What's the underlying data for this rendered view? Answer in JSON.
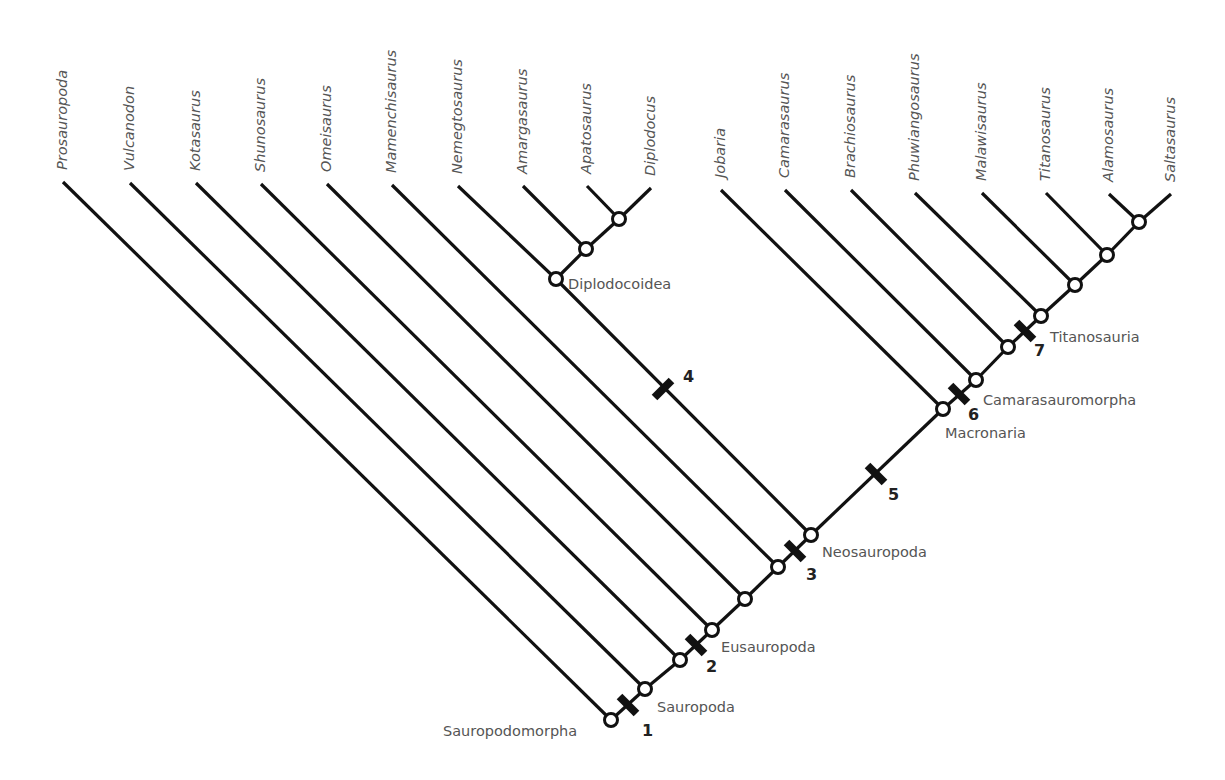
{
  "diagram": {
    "type": "cladogram",
    "colors": {
      "line": "#111111",
      "text": "#555555",
      "number": "#222222",
      "node_fill": "#ffffff",
      "background": "#ffffff"
    },
    "taxa": [
      {
        "name": "Prosauropoda",
        "tip": [
          63,
          182
        ],
        "node": "n0"
      },
      {
        "name": "Vulcanodon",
        "tip": [
          130,
          183
        ],
        "node": "n1"
      },
      {
        "name": "Kotasaurus",
        "tip": [
          196,
          183
        ],
        "node": "n2"
      },
      {
        "name": "Shunosaurus",
        "tip": [
          261,
          184
        ],
        "node": "n3"
      },
      {
        "name": "Omeisaurus",
        "tip": [
          327,
          184
        ],
        "node": "n4"
      },
      {
        "name": "Mamenchisaurus",
        "tip": [
          392,
          185
        ],
        "node": "n5"
      },
      {
        "name": "Nemegtosaurus",
        "tip": [
          458,
          186
        ],
        "node": "d0"
      },
      {
        "name": "Amargasaurus",
        "tip": [
          523,
          186
        ],
        "node": "d1"
      },
      {
        "name": "Apatosaurus",
        "tip": [
          587,
          186
        ],
        "node": "d2"
      },
      {
        "name": "Diplodocus",
        "tip": [
          651,
          188
        ],
        "node": "d2"
      },
      {
        "name": "Jobaria",
        "tip": [
          721,
          190
        ],
        "node": "m0"
      },
      {
        "name": "Camarasaurus",
        "tip": [
          785,
          190
        ],
        "node": "m1"
      },
      {
        "name": "Brachiosaurus",
        "tip": [
          851,
          190
        ],
        "node": "m2"
      },
      {
        "name": "Phuwiangosaurus",
        "tip": [
          915,
          193
        ],
        "node": "m3"
      },
      {
        "name": "Malawisaurus",
        "tip": [
          982,
          193
        ],
        "node": "m4"
      },
      {
        "name": "Titanosaurus",
        "tip": [
          1046,
          193
        ],
        "node": "m5"
      },
      {
        "name": "Alamosaurus",
        "tip": [
          1109,
          194
        ],
        "node": "m6"
      },
      {
        "name": "Saltasaurus",
        "tip": [
          1171,
          194
        ],
        "node": "m6"
      }
    ],
    "nodes": {
      "n0": [
        611,
        720
      ],
      "n1": [
        645,
        689
      ],
      "n2": [
        680,
        660
      ],
      "n3": [
        712,
        630
      ],
      "n4": [
        745,
        599
      ],
      "n5": [
        778,
        567
      ],
      "neo": [
        811,
        535
      ],
      "d0": [
        556,
        279
      ],
      "d1": [
        586,
        249
      ],
      "d2": [
        619,
        219
      ],
      "m0": [
        943,
        409
      ],
      "m1": [
        976,
        380
      ],
      "m2": [
        1008,
        347
      ],
      "m3": [
        1041,
        316
      ],
      "m4": [
        1075,
        285
      ],
      "m5": [
        1107,
        255
      ],
      "m6": [
        1139,
        222
      ]
    },
    "spine_edges": [
      [
        "n0",
        "n1"
      ],
      [
        "n1",
        "n2"
      ],
      [
        "n2",
        "n3"
      ],
      [
        "n3",
        "n4"
      ],
      [
        "n4",
        "n5"
      ],
      [
        "n5",
        "neo"
      ],
      [
        "neo",
        "m0"
      ],
      [
        "m0",
        "m1"
      ],
      [
        "m1",
        "m2"
      ],
      [
        "m2",
        "m3"
      ],
      [
        "m3",
        "m4"
      ],
      [
        "m4",
        "m5"
      ],
      [
        "m5",
        "m6"
      ],
      [
        "neo",
        "d0"
      ],
      [
        "d0",
        "d1"
      ],
      [
        "d1",
        "d2"
      ]
    ],
    "clades": [
      {
        "name": "Sauropodomorpha",
        "x": 443,
        "y": 736
      },
      {
        "name": "Sauropoda",
        "x": 657,
        "y": 712
      },
      {
        "name": "Eusauropoda",
        "x": 721,
        "y": 652
      },
      {
        "name": "Neosauropoda",
        "x": 822,
        "y": 557
      },
      {
        "name": "Diplodocoidea",
        "x": 568,
        "y": 289
      },
      {
        "name": "Macronaria",
        "x": 945,
        "y": 438
      },
      {
        "name": "Camarasauromorpha",
        "x": 983,
        "y": 405
      },
      {
        "name": "Titanosauria",
        "x": 1050,
        "y": 342
      }
    ],
    "synapomorphies": [
      {
        "label": "1",
        "center": [
          628,
          705
        ],
        "label_pos": [
          642,
          736
        ]
      },
      {
        "label": "2",
        "center": [
          696,
          645
        ],
        "label_pos": [
          706,
          672
        ]
      },
      {
        "label": "3",
        "center": [
          795,
          551
        ],
        "label_pos": [
          806,
          580
        ]
      },
      {
        "label": "4",
        "center": [
          663,
          389
        ],
        "label_pos": [
          683,
          382
        ]
      },
      {
        "label": "5",
        "center": [
          876,
          474
        ],
        "label_pos": [
          888,
          500
        ]
      },
      {
        "label": "6",
        "center": [
          959,
          394
        ],
        "label_pos": [
          968,
          420
        ]
      },
      {
        "label": "7",
        "center": [
          1025,
          331
        ],
        "label_pos": [
          1034,
          356
        ]
      }
    ]
  }
}
